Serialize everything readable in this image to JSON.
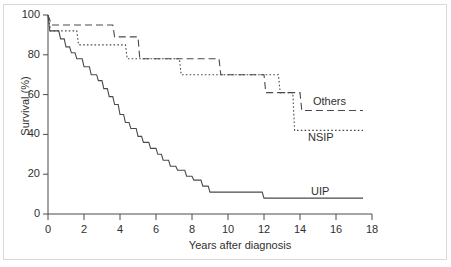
{
  "figure": {
    "background_color": "#ffffff",
    "line_color": "#4a4a4a",
    "text_color": "#2f2f2f",
    "frame_color": "#d8d8d8"
  },
  "chart_data": {
    "type": "line",
    "subtype": "kaplan-meier-step",
    "title": "",
    "xlabel": "Years after diagnosis",
    "ylabel": "Survival (%)",
    "xlim": [
      0,
      18
    ],
    "ylim": [
      0,
      100
    ],
    "xticks": [
      0,
      2,
      4,
      6,
      8,
      10,
      12,
      14,
      16,
      18
    ],
    "yticks": [
      0,
      20,
      40,
      60,
      80,
      100
    ],
    "xtick_labels": [
      "0",
      "2",
      "4",
      "6",
      "8",
      "10",
      "12",
      "14",
      "16",
      "18"
    ],
    "ytick_labels": [
      "0",
      "20",
      "40",
      "60",
      "80",
      "100"
    ],
    "grid": false,
    "legend_position": "inline-annotations",
    "series": [
      {
        "name": "Others",
        "label": "Others",
        "linestyle": "dashed",
        "annotation_x": 14.8,
        "annotation_y": 57,
        "points": [
          [
            0.0,
            100
          ],
          [
            0.2,
            95
          ],
          [
            3.6,
            95
          ],
          [
            3.7,
            89
          ],
          [
            5.0,
            89
          ],
          [
            5.1,
            78
          ],
          [
            9.5,
            78
          ],
          [
            9.6,
            70
          ],
          [
            12.0,
            70
          ],
          [
            12.1,
            61
          ],
          [
            14.0,
            61
          ],
          [
            14.1,
            52
          ],
          [
            17.5,
            52
          ]
        ]
      },
      {
        "name": "NSIP",
        "label": "NSIP",
        "linestyle": "dotted",
        "annotation_x": 14.5,
        "annotation_y": 38,
        "points": [
          [
            0.0,
            100
          ],
          [
            0.15,
            92
          ],
          [
            1.6,
            92
          ],
          [
            1.7,
            85
          ],
          [
            4.3,
            85
          ],
          [
            4.4,
            78
          ],
          [
            7.3,
            78
          ],
          [
            7.4,
            70
          ],
          [
            12.8,
            70
          ],
          [
            12.9,
            61
          ],
          [
            13.6,
            61
          ],
          [
            13.7,
            42
          ],
          [
            17.5,
            42
          ]
        ]
      },
      {
        "name": "UIP",
        "label": "UIP",
        "linestyle": "solid",
        "annotation_x": 14.6,
        "annotation_y": 17,
        "points": [
          [
            0.0,
            100
          ],
          [
            0.1,
            92
          ],
          [
            0.6,
            92
          ],
          [
            0.7,
            88
          ],
          [
            0.9,
            88
          ],
          [
            1.0,
            84
          ],
          [
            1.2,
            84
          ],
          [
            1.3,
            81
          ],
          [
            1.5,
            81
          ],
          [
            1.6,
            78
          ],
          [
            1.9,
            78
          ],
          [
            2.0,
            74
          ],
          [
            2.3,
            74
          ],
          [
            2.4,
            70
          ],
          [
            2.7,
            70
          ],
          [
            2.8,
            67
          ],
          [
            3.0,
            67
          ],
          [
            3.1,
            63
          ],
          [
            3.3,
            63
          ],
          [
            3.4,
            59
          ],
          [
            3.6,
            59
          ],
          [
            3.7,
            55
          ],
          [
            3.9,
            55
          ],
          [
            4.0,
            50
          ],
          [
            4.2,
            50
          ],
          [
            4.3,
            46
          ],
          [
            4.5,
            46
          ],
          [
            4.6,
            43
          ],
          [
            4.9,
            43
          ],
          [
            5.0,
            39
          ],
          [
            5.2,
            39
          ],
          [
            5.3,
            36
          ],
          [
            5.6,
            36
          ],
          [
            5.7,
            33
          ],
          [
            6.0,
            33
          ],
          [
            6.1,
            30
          ],
          [
            6.3,
            30
          ],
          [
            6.4,
            27
          ],
          [
            6.7,
            27
          ],
          [
            6.8,
            24
          ],
          [
            7.1,
            24
          ],
          [
            7.2,
            22
          ],
          [
            7.6,
            22
          ],
          [
            7.7,
            19
          ],
          [
            8.0,
            19
          ],
          [
            8.1,
            17
          ],
          [
            8.5,
            17
          ],
          [
            8.6,
            14
          ],
          [
            8.9,
            14
          ],
          [
            9.0,
            11
          ],
          [
            11.9,
            11
          ],
          [
            12.0,
            8
          ],
          [
            17.5,
            8
          ]
        ]
      }
    ]
  }
}
